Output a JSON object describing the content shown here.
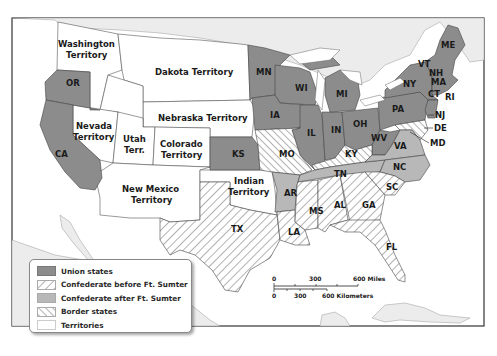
{
  "map": {
    "title": "",
    "colors": {
      "union": "#8c8c8c",
      "confederate_after": "#b8b8b8",
      "territory": "#ffffff",
      "ocean": "#ffffff",
      "foreign_land": "#ececec",
      "border": "#333333"
    },
    "territory_labels": {
      "washington": [
        "Washington",
        "Territory"
      ],
      "dakota": "Dakota Territory",
      "nebraska": "Nebraska Territory",
      "nevada": [
        "Nevada",
        "Territory"
      ],
      "utah": [
        "Utah",
        "Terr."
      ],
      "colorado": [
        "Colorado",
        "Territory"
      ],
      "new_mexico": [
        "New Mexico",
        "Territory"
      ],
      "indian": [
        "Indian",
        "Territory"
      ]
    },
    "union_states": [
      "OR",
      "CA",
      "KS",
      "MN",
      "WI",
      "IA",
      "IL",
      "IN",
      "MI",
      "OH",
      "PA",
      "NY",
      "VT",
      "NH",
      "ME",
      "MA",
      "CT",
      "RI",
      "NJ",
      "WV"
    ],
    "confederate_before_states": [
      "TX",
      "LA",
      "MS",
      "AL",
      "GA",
      "FL",
      "SC"
    ],
    "confederate_after_states": [
      "AR",
      "TN",
      "NC",
      "VA"
    ],
    "border_states": [
      "MO",
      "KY",
      "DE",
      "MD"
    ],
    "state_labels": {
      "OR": "OR",
      "CA": "CA",
      "KS": "KS",
      "MN": "MN",
      "WI": "WI",
      "IA": "IA",
      "IL": "IL",
      "IN": "IN",
      "MI": "MI",
      "OH": "OH",
      "PA": "PA",
      "NY": "NY",
      "VT": "VT",
      "NH": "NH",
      "ME": "ME",
      "MA": "MA",
      "CT": "CT",
      "RI": "RI",
      "NJ": "NJ",
      "DE": "DE",
      "MD": "MD",
      "WV": "WV",
      "VA": "VA",
      "NC": "NC",
      "SC": "SC",
      "GA": "GA",
      "AL": "AL",
      "MS": "MS",
      "LA": "LA",
      "TX": "TX",
      "AR": "AR",
      "TN": "TN",
      "MO": "MO",
      "KY": "KY",
      "FL": "FL"
    }
  },
  "legend": {
    "items": [
      {
        "label": "Union states",
        "pattern": "solid-dark"
      },
      {
        "label": "Confederate before Ft. Sumter",
        "pattern": "hatch-backslash"
      },
      {
        "label": "Confederate after Ft. Sumter",
        "pattern": "solid-light"
      },
      {
        "label": "Border states",
        "pattern": "hatch-slash"
      },
      {
        "label": "Territories",
        "pattern": "blank"
      }
    ]
  },
  "scale_bar": {
    "miles": {
      "zero": "0",
      "mid": "300",
      "end": "600 Miles"
    },
    "kilometers": {
      "zero": "0",
      "mid": "300",
      "end": "600 Kilometers"
    }
  }
}
